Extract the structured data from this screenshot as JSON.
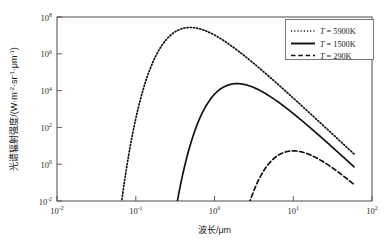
{
  "chart_data": {
    "type": "line",
    "title": "",
    "xlabel": "波长/μm",
    "ylabel": "光谱辐射强度/(W·m⁻²·sr⁻¹·μm⁻¹)",
    "ylabel_parts": {
      "text_cn": "光谱辐射强度/(W·m",
      "exp1": "-2",
      "mid1": "·sr",
      "exp2": "-1",
      "mid2": "·μm",
      "exp3": "-1",
      "tail": ")"
    },
    "xscale": "log",
    "yscale": "log",
    "xlim": [
      0.01,
      100
    ],
    "ylim": [
      0.01,
      100000000
    ],
    "grid": false,
    "xticks": [
      {
        "value": 0.01,
        "mantissa": "10",
        "exponent": "-2"
      },
      {
        "value": 0.1,
        "mantissa": "10",
        "exponent": "-1"
      },
      {
        "value": 1,
        "mantissa": "10",
        "exponent": "0"
      },
      {
        "value": 10,
        "mantissa": "10",
        "exponent": "1"
      },
      {
        "value": 100,
        "mantissa": "10",
        "exponent": "2"
      }
    ],
    "yticks": [
      {
        "value": 100000000,
        "mantissa": "10",
        "exponent": "8"
      },
      {
        "value": 1000000,
        "mantissa": "10",
        "exponent": "6"
      },
      {
        "value": 10000,
        "mantissa": "10",
        "exponent": "4"
      },
      {
        "value": 100,
        "mantissa": "10",
        "exponent": "2"
      },
      {
        "value": 1,
        "mantissa": "10",
        "exponent": "0"
      },
      {
        "value": 0.01,
        "mantissa": "10",
        "exponent": "-2"
      }
    ],
    "legend_position": "top-right",
    "series": [
      {
        "name": "T = 5900K",
        "symbol": "T",
        "equals": "=",
        "temperature": "5900K",
        "style": "dotted",
        "color": "#111111",
        "peak_wavelength_um": 0.49,
        "peak_radiance": 27000000.0,
        "points": [
          [
            0.0655,
            0.01
          ],
          [
            0.07,
            0.6
          ],
          [
            0.075,
            23
          ],
          [
            0.08,
            320
          ],
          [
            0.09,
            16000.0
          ],
          [
            0.1,
            210000.0
          ],
          [
            0.12,
            8000000.0
          ],
          [
            0.14,
            6500000.0
          ],
          [
            0.16,
            1400000.0
          ],
          [
            0.18,
            3600000.0
          ],
          [
            0.2,
            1200000.0
          ],
          [
            0.25,
            6000000.0
          ],
          [
            0.3,
            14000000.0
          ],
          [
            0.35,
            20000000.0
          ],
          [
            0.4,
            24000000.0
          ],
          [
            0.45,
            26500000.0
          ],
          [
            0.49,
            27200000.0
          ],
          [
            0.55,
            26500000.0
          ],
          [
            0.65,
            23500000.0
          ],
          [
            0.8,
            18000000.0
          ],
          [
            1.0,
            12500000.0
          ],
          [
            1.5,
            5000000.0
          ],
          [
            2.0,
            2200000.0
          ],
          [
            3.0,
            600000.0
          ],
          [
            5.0,
            100000.0
          ],
          [
            8.0,
            18000.0
          ],
          [
            12.0,
            3800.0
          ],
          [
            20.0,
            560
          ],
          [
            35.0,
            75
          ],
          [
            55.0,
            13
          ]
        ]
      },
      {
        "name": "T = 1500K",
        "symbol": "T",
        "equals": "=",
        "temperature": "1500K",
        "style": "solid",
        "color": "#111111",
        "peak_wavelength_um": 1.93,
        "peak_radiance": 24000.0,
        "points": [
          [
            0.355,
            0.01
          ],
          [
            0.4,
            0.5
          ],
          [
            0.45,
            8
          ],
          [
            0.5,
            60
          ],
          [
            0.6,
            700
          ],
          [
            0.7,
            2800
          ],
          [
            0.8,
            6200
          ],
          [
            0.9,
            10000.0
          ],
          [
            1.0,
            13500.0
          ],
          [
            1.2,
            19000.0
          ],
          [
            1.5,
            22500.0
          ],
          [
            1.93,
            24000.0
          ],
          [
            2.5,
            22000.0
          ],
          [
            3.0,
            19000.0
          ],
          [
            4.0,
            12500.0
          ],
          [
            5.0,
            8000.0
          ],
          [
            7.0,
            3500.0
          ],
          [
            10.0,
            1300.0
          ],
          [
            15.0,
            380
          ],
          [
            20.0,
            150
          ],
          [
            30.0,
            40
          ],
          [
            45.0,
            10
          ],
          [
            55.0,
            5
          ]
        ]
      },
      {
        "name": "T = 290K",
        "symbol": "T",
        "equals": "=",
        "temperature": "290K",
        "style": "dashed",
        "color": "#111111",
        "peak_wavelength_um": 9.99,
        "peak_radiance": 5.3,
        "points": [
          [
            2.95,
            0.01
          ],
          [
            3.3,
            0.05
          ],
          [
            3.8,
            0.25
          ],
          [
            4.3,
            0.62
          ],
          [
            5.0,
            1.3
          ],
          [
            5.8,
            2.2
          ],
          [
            6.6,
            3.1
          ],
          [
            7.5,
            4.0
          ],
          [
            8.5,
            4.75
          ],
          [
            9.99,
            5.3
          ],
          [
            11.5,
            5.2
          ],
          [
            13.0,
            4.8
          ],
          [
            15.0,
            4.1
          ],
          [
            18.0,
            3.1
          ],
          [
            22.0,
            2.2
          ],
          [
            28.0,
            1.4
          ],
          [
            35.0,
            0.9
          ],
          [
            45.0,
            0.52
          ],
          [
            55.0,
            0.33
          ]
        ]
      }
    ]
  },
  "plot_area": {
    "left_px": 57,
    "right_px": 372,
    "top_px": 17,
    "bottom_px": 201
  }
}
